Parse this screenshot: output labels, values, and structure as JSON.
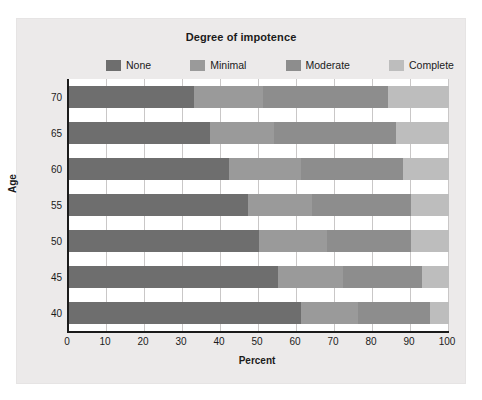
{
  "chart_data": {
    "type": "bar",
    "orientation": "horizontal",
    "stacked": true,
    "stack_mode": "percent",
    "title": "Degree of impotence",
    "xlabel": "Percent",
    "ylabel": "Age",
    "xlim": [
      0,
      100
    ],
    "xticks": [
      0,
      10,
      20,
      30,
      40,
      50,
      60,
      70,
      80,
      90,
      100
    ],
    "grid": "vertical",
    "legend_position": "top",
    "categories": [
      "70",
      "65",
      "60",
      "55",
      "50",
      "45",
      "40"
    ],
    "series": [
      {
        "name": "None",
        "color": "#6e6e6e",
        "values": [
          33,
          37,
          42,
          47,
          50,
          55,
          61
        ]
      },
      {
        "name": "Minimal",
        "color": "#9a9a9a",
        "values": [
          18,
          17,
          19,
          17,
          18,
          17,
          15
        ]
      },
      {
        "name": "Moderate",
        "color": "#8d8d8d",
        "values": [
          33,
          32,
          27,
          26,
          22,
          21,
          19
        ]
      },
      {
        "name": "Complete",
        "color": "#bdbdbd",
        "values": [
          16,
          14,
          12,
          10,
          10,
          7,
          5
        ]
      }
    ],
    "cumulative_boundaries": {
      "70": [
        33,
        51,
        84,
        100
      ],
      "65": [
        37,
        54,
        86,
        100
      ],
      "60": [
        42,
        61,
        88,
        100
      ],
      "55": [
        47,
        64,
        90,
        100
      ],
      "50": [
        50,
        68,
        90,
        100
      ],
      "45": [
        55,
        72,
        93,
        100
      ],
      "40": [
        61,
        76,
        95,
        100
      ]
    }
  },
  "colors": {
    "panel_background": "#eceaea",
    "plot_background": "#ffffff",
    "axis": "#1b1b1b",
    "gridline": "#c9c7c7",
    "text": "#1b1b1b"
  }
}
